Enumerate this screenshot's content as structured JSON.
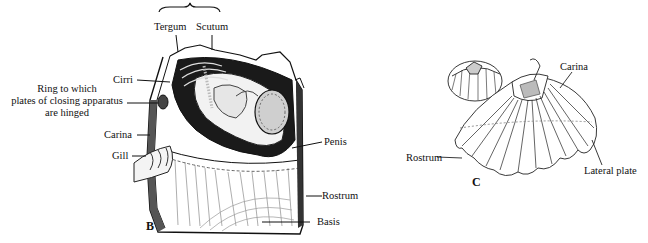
{
  "figure": {
    "panel_b": {
      "letter": "B",
      "labels": {
        "tergum": "Tergum",
        "scutum": "Scutum",
        "cirri": "Cirri",
        "ring_line1": "Ring to which",
        "ring_line2": "plates of closing apparatus",
        "ring_line3": "are hinged",
        "carina": "Carina",
        "gill": "Gill",
        "penis": "Penis",
        "rostrum": "Rostrum",
        "basis": "Basis"
      }
    },
    "panel_c": {
      "letter": "C",
      "labels": {
        "carina": "Carina",
        "rostrum": "Rostrum",
        "lateral_plate": "Lateral plate"
      }
    }
  }
}
